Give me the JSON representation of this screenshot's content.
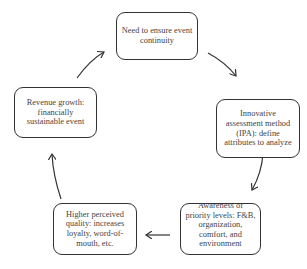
{
  "diagram": {
    "type": "cycle",
    "nodes": [
      {
        "id": "continuity",
        "text": "Need to ensure event continuity"
      },
      {
        "id": "ipa",
        "text": "Innovative assessment method (IPA): define attributes to analyze"
      },
      {
        "id": "priority",
        "text": "Awareness of priority levels: F&B, organization, comfort, and environment"
      },
      {
        "id": "quality",
        "text": "Higher perceived quality: increases loyalty, word-of-mouth, etc."
      },
      {
        "id": "revenue",
        "text": "Revenue growth: financially sustainable event"
      }
    ],
    "edges": [
      {
        "from": "continuity",
        "to": "ipa"
      },
      {
        "from": "ipa",
        "to": "priority"
      },
      {
        "from": "priority",
        "to": "quality"
      },
      {
        "from": "quality",
        "to": "revenue"
      },
      {
        "from": "revenue",
        "to": "continuity"
      }
    ],
    "colors": {
      "stroke": "#333333",
      "text": "#444444",
      "background": "#ffffff"
    }
  }
}
